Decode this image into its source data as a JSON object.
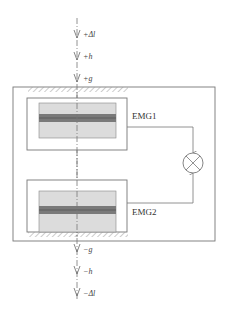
{
  "diagram": {
    "type": "dual-electromagnet-gradiometer-schematic",
    "colors": {
      "line": "#666666",
      "frame": "#777777",
      "inner_fill": "#dcdcdc",
      "stripe": "#7a7a7a",
      "hatch": "#999999"
    },
    "top_arrows": [
      {
        "label": "+Δl"
      },
      {
        "label": "+h⃗"
      },
      {
        "label": "+g⃗"
      }
    ],
    "bottom_arrows": [
      {
        "label": "−g⃗"
      },
      {
        "label": "−h⃗"
      },
      {
        "label": "−Δl"
      }
    ],
    "sensors": [
      {
        "id": "upper",
        "label": "EMG1"
      },
      {
        "id": "lower",
        "label": "EMG2"
      }
    ],
    "combiner": {
      "symbol": "⊗",
      "icon": "mixer-circle-cross-icon"
    }
  }
}
